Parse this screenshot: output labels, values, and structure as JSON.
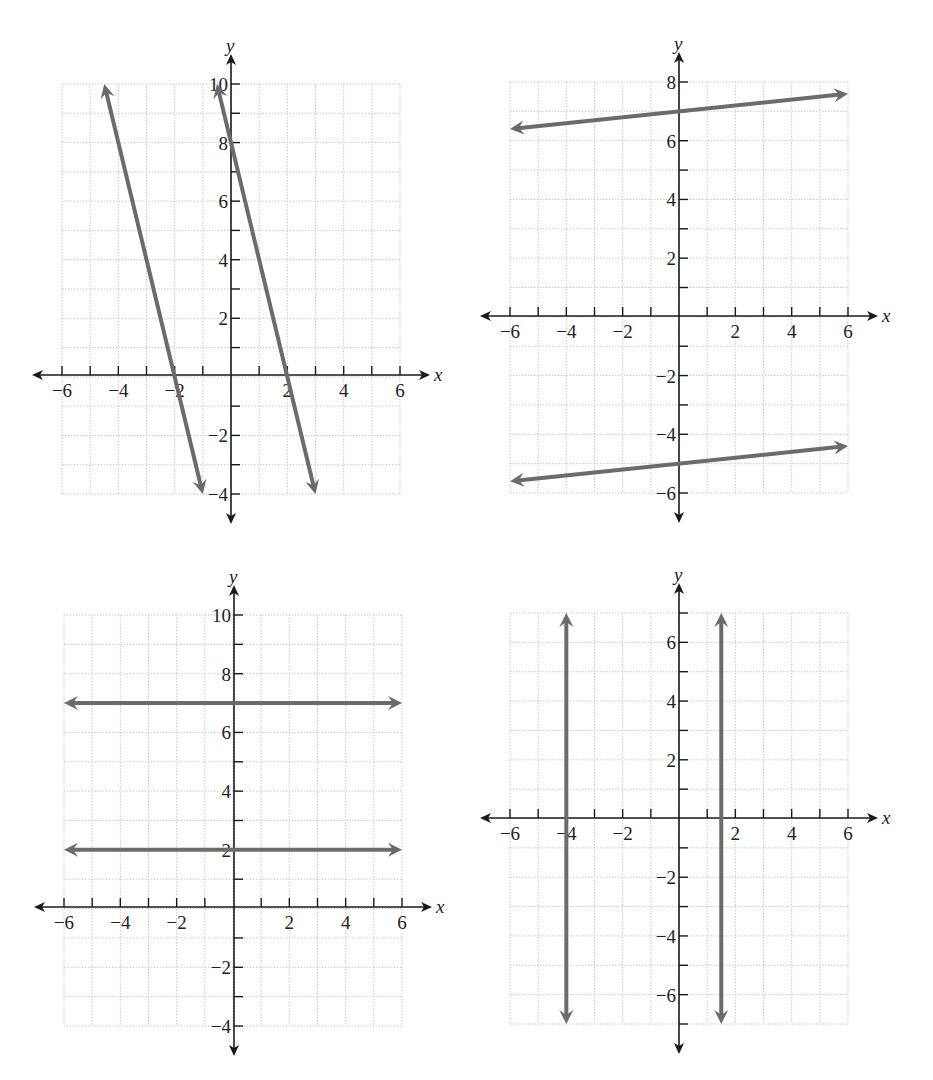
{
  "colors": {
    "line": "#6b6b6b",
    "axis": "#1a1a1a",
    "grid": "#c9c9c9",
    "text": "#222222"
  },
  "chart_data": [
    {
      "type": "line",
      "title": "",
      "xlabel": "x",
      "ylabel": "y",
      "xlim": [
        -6,
        6
      ],
      "ylim": [
        -4,
        10
      ],
      "grid": true,
      "x_tick_labels": [
        "-6",
        "-4",
        "-2",
        "2",
        "4",
        "6"
      ],
      "y_tick_labels": [
        "10",
        "8",
        "6",
        "4",
        "2",
        "-2",
        "-4"
      ],
      "series": [
        {
          "name": "line A",
          "equation": "y = -4x - 8",
          "x": [
            -4.5,
            -1
          ],
          "y": [
            10,
            -4
          ]
        },
        {
          "name": "line B",
          "equation": "y = -4x + 8",
          "x": [
            -0.5,
            3
          ],
          "y": [
            10,
            -4
          ]
        }
      ],
      "layout": {
        "left": 62,
        "right": 400,
        "top": 84,
        "bottom": 494,
        "origin_x": 231,
        "origin_y": 375
      }
    },
    {
      "type": "line",
      "title": "",
      "xlabel": "x",
      "ylabel": "y",
      "xlim": [
        -6,
        6
      ],
      "ylim": [
        -6,
        8
      ],
      "grid": true,
      "x_tick_labels": [
        "-6",
        "-4",
        "-2",
        "2",
        "4",
        "6"
      ],
      "y_tick_labels": [
        "8",
        "6",
        "4",
        "2",
        "-2",
        "-4",
        "-6"
      ],
      "series": [
        {
          "name": "line A",
          "equation": "y = 0.1x + 7",
          "x": [
            -6,
            6
          ],
          "y": [
            6.4,
            7.6
          ]
        },
        {
          "name": "line B",
          "equation": "y = 0.1x - 5",
          "x": [
            -6,
            6
          ],
          "y": [
            -5.6,
            -4.4
          ]
        }
      ],
      "layout": {
        "left": 510,
        "right": 848,
        "top": 82,
        "bottom": 493,
        "origin_x": 679,
        "origin_y": 316
      }
    },
    {
      "type": "line",
      "title": "",
      "xlabel": "x",
      "ylabel": "y",
      "xlim": [
        -6,
        6
      ],
      "ylim": [
        -4,
        10
      ],
      "grid": true,
      "x_tick_labels": [
        "-6",
        "-4",
        "-2",
        "2",
        "4",
        "6"
      ],
      "y_tick_labels": [
        "10",
        "8",
        "6",
        "4",
        "2",
        "-2",
        "-4"
      ],
      "series": [
        {
          "name": "line A",
          "equation": "y = 7",
          "x": [
            -6,
            6
          ],
          "y": [
            7,
            7
          ]
        },
        {
          "name": "line B",
          "equation": "y = 2",
          "x": [
            -6,
            6
          ],
          "y": [
            2,
            2
          ]
        }
      ],
      "layout": {
        "left": 64,
        "right": 402,
        "top": 615,
        "bottom": 1026,
        "origin_x": 234,
        "origin_y": 907
      }
    },
    {
      "type": "line",
      "title": "",
      "xlabel": "x",
      "ylabel": "y",
      "xlim": [
        -6,
        6
      ],
      "ylim": [
        -7,
        7
      ],
      "grid": true,
      "x_tick_labels": [
        "-6",
        "-4",
        "-2",
        "2",
        "4",
        "6"
      ],
      "y_tick_labels": [
        "6",
        "4",
        "2",
        "-2",
        "-4",
        "-6"
      ],
      "series": [
        {
          "name": "line A",
          "equation": "x = -4",
          "x": [
            -4,
            -4
          ],
          "y": [
            7,
            -7
          ]
        },
        {
          "name": "line B",
          "equation": "x = 1.5",
          "x": [
            1.5,
            1.5
          ],
          "y": [
            7,
            -7
          ]
        }
      ],
      "layout": {
        "left": 510,
        "right": 848,
        "top": 613,
        "bottom": 1024,
        "origin_x": 679,
        "origin_y": 818
      }
    }
  ]
}
